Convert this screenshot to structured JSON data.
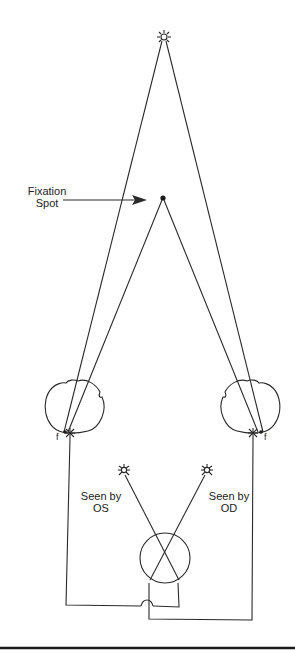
{
  "diagram": {
    "title": "",
    "labels": {
      "fixation_spot": "Fixation\nSpot",
      "seen_by_os": "Seen by\nOS",
      "seen_by_od": "Seen by\nOD",
      "fovea_left": "f",
      "fovea_right": "f"
    },
    "elements": {
      "distant_star": "star-icon",
      "fixation_point": "dot",
      "left_eye": "eye-outline",
      "right_eye": "eye-outline",
      "left_perceived_star": "star-icon",
      "right_perceived_star": "star-icon",
      "fusion_circle": "circle"
    },
    "colors": {
      "line": "#2a2a2a",
      "background": "#ffffff"
    }
  }
}
